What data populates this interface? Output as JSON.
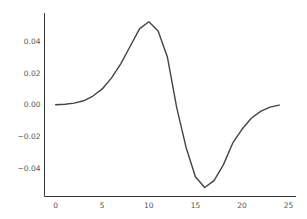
{
  "chart_data": {
    "type": "line",
    "title": "",
    "xlabel": "",
    "ylabel": "",
    "xlim": [
      -1.2,
      25.8
    ],
    "ylim": [
      -0.058,
      0.058
    ],
    "grid": false,
    "legend": null,
    "x_ticks": [
      0,
      5,
      10,
      15,
      20,
      25
    ],
    "x_tick_labels": [
      "0",
      "5",
      "10",
      "15",
      "20",
      "25"
    ],
    "y_ticks": [
      0.04,
      0.02,
      0.0,
      -0.02,
      -0.04
    ],
    "y_tick_labels": [
      "0.04",
      "0.02",
      "0.00",
      "−0.02",
      "−0.04"
    ],
    "series": [
      {
        "name": "series",
        "color": "#444444",
        "x": [
          0,
          1,
          2,
          3,
          4,
          5,
          6,
          7,
          8,
          9,
          10,
          11,
          12,
          13,
          14,
          15,
          16,
          17,
          18,
          19,
          20,
          21,
          22,
          23,
          24
        ],
        "values": [
          0.0,
          0.0003,
          0.001,
          0.0025,
          0.0055,
          0.01,
          0.017,
          0.026,
          0.037,
          0.048,
          0.0525,
          0.0466,
          0.03,
          -0.002,
          -0.027,
          -0.0455,
          -0.0523,
          -0.048,
          -0.038,
          -0.0243,
          -0.0155,
          -0.0085,
          -0.0042,
          -0.0015,
          -0.0002
        ]
      }
    ]
  }
}
